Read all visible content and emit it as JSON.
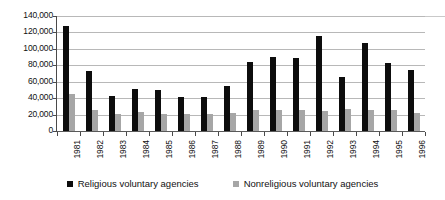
{
  "chart_data": {
    "type": "bar",
    "title": "",
    "subtitle": "",
    "xlabel": "",
    "ylabel": "",
    "categories": [
      "1981",
      "1982",
      "1983",
      "1984",
      "1985",
      "1986",
      "1987",
      "1988",
      "1989",
      "1990",
      "1991",
      "1992",
      "1993",
      "1994",
      "1995",
      "1996"
    ],
    "series": [
      {
        "name": "Religious voluntary agencies",
        "color": "#0d0d0d",
        "values": [
          128000,
          73000,
          43000,
          51000,
          50000,
          41000,
          41000,
          55000,
          84000,
          90000,
          89000,
          116000,
          66000,
          107000,
          83000,
          74000
        ]
      },
      {
        "name": "Nonreligious voluntary agencies",
        "color": "#a6a6a6",
        "values": [
          45000,
          26000,
          21000,
          23000,
          21000,
          21000,
          21000,
          22000,
          25000,
          25000,
          25000,
          24000,
          27000,
          26000,
          26000,
          22000
        ]
      }
    ],
    "ylim": [
      0,
      140000
    ],
    "ytick_values": [
      0,
      20000,
      40000,
      60000,
      80000,
      100000,
      120000,
      140000
    ],
    "ytick_labels": [
      "0",
      "20,000",
      "40,000",
      "60,000",
      "80,000",
      "100,000",
      "120,000",
      "140,000"
    ],
    "grid": true,
    "grid_axis": "y",
    "legend_position": "bottom",
    "legend": [
      {
        "label": "Religious voluntary agencies",
        "swatch": "black-square-icon",
        "color": "#0d0d0d"
      },
      {
        "label": "Nonreligious voluntary agencies",
        "swatch": "gray-square-icon",
        "color": "#a6a6a6"
      }
    ]
  },
  "colors": {
    "religious": "#0d0d0d",
    "nonreligious": "#a6a6a6",
    "gridline": "#b8b8b8",
    "axis": "#4a4a4a",
    "background": "#ffffff"
  }
}
